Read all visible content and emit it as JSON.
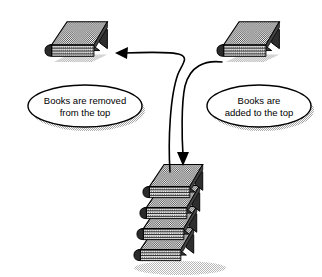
{
  "diagram": {
    "colors": {
      "background": "#ffffff",
      "outline": "#000000",
      "book_cover": "#8a8a8a",
      "book_cover_dark": "#6e6e6e",
      "book_spine": "#3c3c3c",
      "page_block": "#d8d8d8",
      "page_line": "#1a1a1a",
      "shadow": "#b4b4b4",
      "callout_fill": "#ffffff"
    },
    "callouts": [
      {
        "id": "removed",
        "lines": [
          "Books are removed",
          "from the top"
        ],
        "cx": 85,
        "cy": 106,
        "rx": 57,
        "ry": 21
      },
      {
        "id": "added",
        "lines": [
          "Books are",
          "added to the top"
        ],
        "cx": 259,
        "cy": 106,
        "rx": 52,
        "ry": 21
      }
    ],
    "books": [
      {
        "id": "top-left-book",
        "label": "single book removed from the top",
        "count": 1
      },
      {
        "id": "top-right-book",
        "label": "single book added to the top",
        "count": 1
      },
      {
        "id": "book-stack",
        "label": "stack of books",
        "count": 4
      }
    ],
    "arrows": [
      {
        "id": "remove-arrow",
        "label": "pop: from stack to top-left book",
        "direction": "left"
      },
      {
        "id": "add-arrow",
        "label": "push: from top-right book to stack",
        "direction": "down"
      }
    ]
  }
}
